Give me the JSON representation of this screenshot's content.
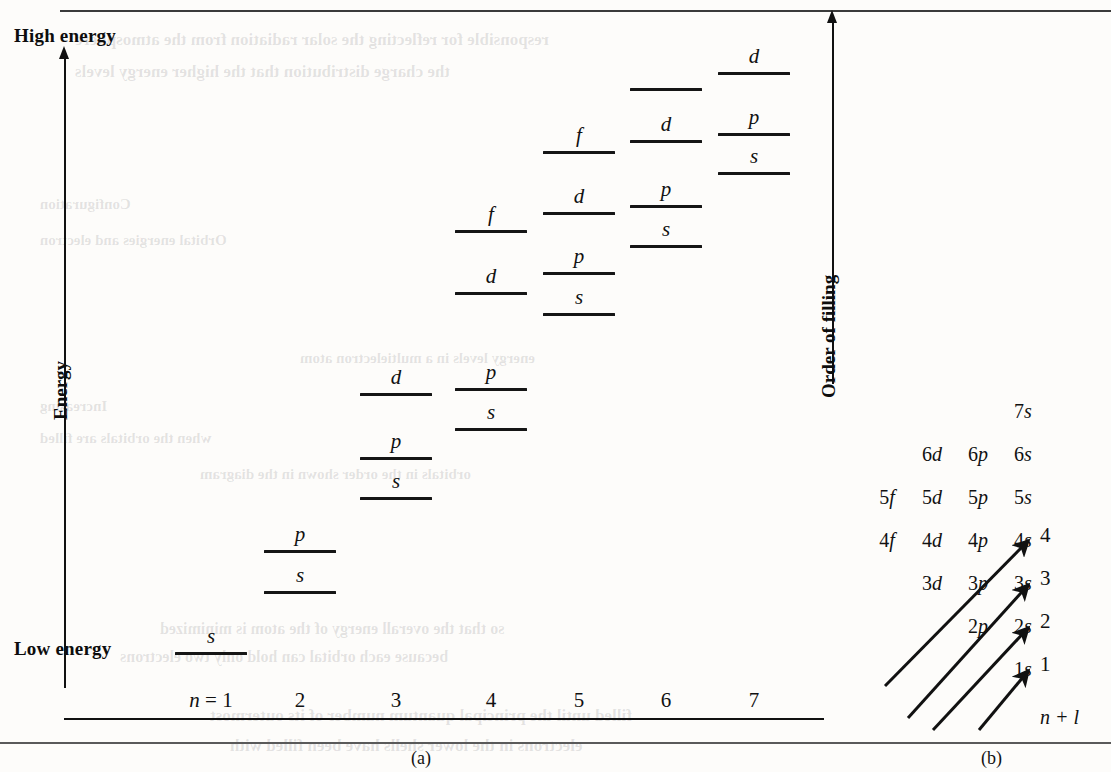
{
  "figure": {
    "panel_a_caption": "(a)",
    "panel_b_caption": "(b)",
    "axis": {
      "high_energy_label": "High energy",
      "low_energy_label": "Low energy",
      "energy_axis_label": "Energy",
      "order_of_filling_label": "Order of filling"
    },
    "n_ticks": [
      {
        "label": "n = 1",
        "n": 1
      },
      {
        "label": "2",
        "n": 2
      },
      {
        "label": "3",
        "n": 3
      },
      {
        "label": "4",
        "n": 4
      },
      {
        "label": "5",
        "n": 5
      },
      {
        "label": "6",
        "n": 6
      },
      {
        "label": "7",
        "n": 7
      }
    ],
    "shells": [
      {
        "n": 1,
        "x": 175,
        "width": 72,
        "levels": [
          {
            "tag": "s",
            "y": 652
          }
        ]
      },
      {
        "n": 2,
        "x": 264,
        "width": 72,
        "levels": [
          {
            "tag": "s",
            "y": 591
          },
          {
            "tag": "p",
            "y": 550
          }
        ]
      },
      {
        "n": 3,
        "x": 360,
        "width": 72,
        "levels": [
          {
            "tag": "s",
            "y": 497
          },
          {
            "tag": "p",
            "y": 457
          },
          {
            "tag": "d",
            "y": 393
          }
        ]
      },
      {
        "n": 4,
        "x": 455,
        "width": 72,
        "levels": [
          {
            "tag": "s",
            "y": 428
          },
          {
            "tag": "p",
            "y": 388
          },
          {
            "tag": "d",
            "y": 292
          },
          {
            "tag": "f",
            "y": 230
          }
        ]
      },
      {
        "n": 5,
        "x": 543,
        "width": 72,
        "levels": [
          {
            "tag": "s",
            "y": 313
          },
          {
            "tag": "p",
            "y": 272
          },
          {
            "tag": "d",
            "y": 212
          },
          {
            "tag": "f",
            "y": 151
          }
        ]
      },
      {
        "n": 6,
        "x": 630,
        "width": 72,
        "levels": [
          {
            "tag": "s",
            "y": 245
          },
          {
            "tag": "p",
            "y": 205
          },
          {
            "tag": "d",
            "y": 140
          },
          {
            "tag": "",
            "y": 88
          }
        ]
      },
      {
        "n": 7,
        "x": 718,
        "width": 72,
        "levels": [
          {
            "tag": "s",
            "y": 172
          },
          {
            "tag": "p",
            "y": 133
          },
          {
            "tag": "d",
            "y": 72
          }
        ]
      }
    ],
    "madelung": {
      "n_plus_l_label": "n + l",
      "rows": [
        {
          "cells": [
            {
              "label": "7s",
              "col": 4
            }
          ]
        },
        {
          "cells": [
            {
              "label": "6d",
              "col": 2
            },
            {
              "label": "6p",
              "col": 3
            },
            {
              "label": "6s",
              "col": 4
            }
          ]
        },
        {
          "cells": [
            {
              "label": "5f",
              "col": 1
            },
            {
              "label": "5d",
              "col": 2
            },
            {
              "label": "5p",
              "col": 3
            },
            {
              "label": "5s",
              "col": 4
            }
          ]
        },
        {
          "cells": [
            {
              "label": "4f",
              "col": 1
            },
            {
              "label": "4d",
              "col": 2
            },
            {
              "label": "4p",
              "col": 3
            },
            {
              "label": "4s",
              "col": 4
            }
          ]
        },
        {
          "cells": [
            {
              "label": "3d",
              "col": 2
            },
            {
              "label": "3p",
              "col": 3
            },
            {
              "label": "3s",
              "col": 4
            }
          ]
        },
        {
          "cells": [
            {
              "label": "2p",
              "col": 3
            },
            {
              "label": "2s",
              "col": 4
            }
          ]
        },
        {
          "cells": [
            {
              "label": "1s",
              "col": 4
            }
          ]
        }
      ],
      "arrow_numbers": [
        "1",
        "2",
        "3",
        "4"
      ]
    }
  },
  "ghost_text": [
    {
      "text": "responsible for reflecting the solar radiation from the atmosphere",
      "x": 75,
      "y": 30,
      "size": 17
    },
    {
      "text": "the charge distribution that the higher energy levels",
      "x": 75,
      "y": 62,
      "size": 17
    },
    {
      "text": "Configuration",
      "x": 40,
      "y": 196,
      "size": 15
    },
    {
      "text": "Orbital energies and electron",
      "x": 40,
      "y": 232,
      "size": 15
    },
    {
      "text": "energy levels in a multielectron atom",
      "x": 300,
      "y": 350,
      "size": 15
    },
    {
      "text": "Increasing",
      "x": 40,
      "y": 398,
      "size": 15
    },
    {
      "text": "when the orbitals are filled",
      "x": 40,
      "y": 430,
      "size": 15
    },
    {
      "text": "orbitals in the order shown in the diagram",
      "x": 200,
      "y": 466,
      "size": 15
    },
    {
      "text": "so that the overall energy of the atom is minimized",
      "x": 160,
      "y": 620,
      "size": 16
    },
    {
      "text": "because each orbital can hold only two electrons",
      "x": 120,
      "y": 648,
      "size": 16
    },
    {
      "text": "filled until the principal quantum number of its outermost",
      "x": 210,
      "y": 706,
      "size": 17
    },
    {
      "text": "electrons in the lower shells have been filled with",
      "x": 230,
      "y": 736,
      "size": 17
    }
  ]
}
